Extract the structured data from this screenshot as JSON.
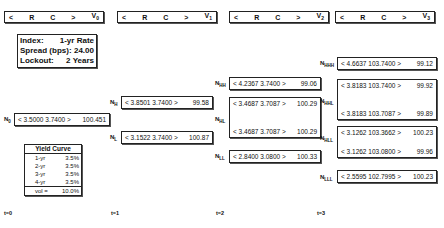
{
  "headers": [
    {
      "lt": "<",
      "r": "R",
      "c": "C",
      "gt": ">",
      "v": "V",
      "sub": "0"
    },
    {
      "lt": "<",
      "r": "R",
      "c": "C",
      "gt": ">",
      "v": "V",
      "sub": "1"
    },
    {
      "lt": "<",
      "r": "R",
      "c": "C",
      "gt": ">",
      "v": "V",
      "sub": "2"
    },
    {
      "lt": "<",
      "r": "R",
      "c": "C",
      "gt": ">",
      "v": "V",
      "sub": "3"
    }
  ],
  "info": {
    "index_label": "Index:",
    "index_value": "1-yr Rate",
    "spread_label": "Spread (bps):",
    "spread_value": "24.00",
    "lockout_label": "Lockout:",
    "lockout_value": "2 Years"
  },
  "yield_curve": {
    "title": "Yield Curve",
    "rows": [
      {
        "k": "1-yr",
        "v": "3.5%"
      },
      {
        "k": "2-yr",
        "v": "3.5%"
      },
      {
        "k": "3-yr",
        "v": "3.5%"
      },
      {
        "k": "4-yr",
        "v": "3.5%"
      }
    ],
    "vol_label": "vol =",
    "vol_value": "10.0%"
  },
  "nodes": {
    "N0": {
      "label": "N",
      "sub": "0",
      "rows": [
        [
          "< 3.5000 3.7400 >",
          "100.451"
        ]
      ]
    },
    "NH": {
      "label": "N",
      "sub": "H",
      "rows": [
        [
          "< 3.8501 3.7400 >",
          "99.58"
        ]
      ]
    },
    "NL": {
      "label": "N",
      "sub": "L",
      "rows": [
        [
          "< 3.1522 3.7400 >",
          "100.87"
        ]
      ]
    },
    "NHH": {
      "label": "N",
      "sub": "HH",
      "rows": [
        [
          "< 4.2367 3.7400 >",
          "99.06"
        ]
      ]
    },
    "NHL": {
      "label": "N",
      "sub": "HL",
      "rows": [
        [
          "< 3.4687 3.7087 >",
          "100.29"
        ],
        [
          "< 3.4687 3.7087 >",
          "100.29"
        ]
      ]
    },
    "NLL": {
      "label": "N",
      "sub": "LL",
      "rows": [
        [
          "< 2.8400 3.0800 >",
          "100.33"
        ]
      ]
    },
    "NHHH": {
      "label": "N",
      "sub": "HHH",
      "rows": [
        [
          "< 4.6637 103.7400 >",
          "99.12"
        ]
      ]
    },
    "NHHL": {
      "label": "N",
      "sub": "HHL",
      "rows": [
        [
          "< 3.8183 103.7400 >",
          "99.92"
        ],
        [
          "< 3.8183 103.7087 >",
          "99.89"
        ]
      ]
    },
    "NHLL": {
      "label": "N",
      "sub": "HLL",
      "rows": [
        [
          "< 3.1262 103.3662 >",
          "100.23"
        ],
        [
          "< 3.1262 103.0800 >",
          "99.96"
        ]
      ]
    },
    "NLLL": {
      "label": "N",
      "sub": "LLL",
      "rows": [
        [
          "< 2.5595 102.7995 >",
          "100.23"
        ]
      ]
    }
  },
  "times": [
    "t=0",
    "t=1",
    "t=2",
    "t=3"
  ]
}
